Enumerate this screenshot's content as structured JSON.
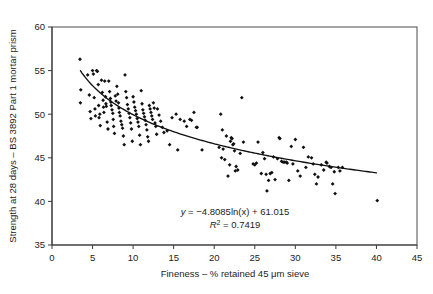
{
  "chart_data": {
    "type": "scatter",
    "title": "",
    "subtitle": "",
    "xlabel": "Fineness – % retained 45 μm sieve",
    "ylabel": "Strength at 28 days – BS 3892 Part 1 mortar prism",
    "xlim": [
      0,
      45
    ],
    "ylim": [
      35,
      60
    ],
    "xticks": [
      0,
      5,
      10,
      15,
      20,
      25,
      30,
      35,
      40,
      45
    ],
    "yticks": [
      35,
      40,
      45,
      50,
      55,
      60
    ],
    "xtick_labels": [
      "0",
      "5",
      "10",
      "15",
      "20",
      "25",
      "30",
      "35",
      "40",
      "45"
    ],
    "ytick_labels": [
      "35",
      "40",
      "45",
      "50",
      "55",
      "60"
    ],
    "grid": false,
    "legend": false,
    "legend_position": "none",
    "marker_color": "#111111",
    "curve_color": "#111111",
    "border_color": "#4a4a4a",
    "annotations": [
      {
        "name": "regression-equation",
        "text": "y = −4.8085ln(x) + 61.015",
        "x": 22.5,
        "y": 38.6
      },
      {
        "name": "r-squared",
        "text": "R² = 0.7419",
        "x": 22.5,
        "y": 37.5
      }
    ],
    "equation": {
      "variable_y": "y",
      "equals": "= −4.8085ln(x) + 61.015",
      "r_symbol": "R",
      "r_exponent": "2",
      "r_value": "= 0.7419",
      "slope_coefficient": -4.8085,
      "intercept": 61.015,
      "r_squared": 0.7419,
      "form": "logarithmic"
    },
    "fit_curve": {
      "type": "logarithmic",
      "expression": "y = -4.8085*ln(x) + 61.015",
      "x_start": 3.5,
      "x_end": 40.0
    },
    "series": [
      {
        "name": "Cement samples",
        "points": [
          [
            3.45,
            56.3
          ],
          [
            3.55,
            52.8
          ],
          [
            3.5,
            51.3
          ],
          [
            4.4,
            54.5
          ],
          [
            4.6,
            52.2
          ],
          [
            4.7,
            50.3
          ],
          [
            4.8,
            49.5
          ],
          [
            5.0,
            55.0
          ],
          [
            5.1,
            54.6
          ],
          [
            5.2,
            51.9
          ],
          [
            5.3,
            50.6
          ],
          [
            5.35,
            49.8
          ],
          [
            5.5,
            55.0
          ],
          [
            5.6,
            54.9
          ],
          [
            5.7,
            53.4
          ],
          [
            5.75,
            51.0
          ],
          [
            5.8,
            49.6
          ],
          [
            5.9,
            50.0
          ],
          [
            5.95,
            48.7
          ],
          [
            6.1,
            53.9
          ],
          [
            6.2,
            52.5
          ],
          [
            6.3,
            51.6
          ],
          [
            6.35,
            50.8
          ],
          [
            6.4,
            50.2
          ],
          [
            6.5,
            53.8
          ],
          [
            6.6,
            52.0
          ],
          [
            6.65,
            51.2
          ],
          [
            6.7,
            50.9
          ],
          [
            6.8,
            49.1
          ],
          [
            6.9,
            48.3
          ],
          [
            7.0,
            53.8
          ],
          [
            7.1,
            52.6
          ],
          [
            7.2,
            51.8
          ],
          [
            7.25,
            51.4
          ],
          [
            7.3,
            51.0
          ],
          [
            7.4,
            50.5
          ],
          [
            7.5,
            50.1
          ],
          [
            7.55,
            49.4
          ],
          [
            7.6,
            48.6
          ],
          [
            7.7,
            47.8
          ],
          [
            7.8,
            52.1
          ],
          [
            7.9,
            51.5
          ],
          [
            8.0,
            53.2
          ],
          [
            8.1,
            52.3
          ],
          [
            8.2,
            51.3
          ],
          [
            8.25,
            50.7
          ],
          [
            8.3,
            50.2
          ],
          [
            8.4,
            49.8
          ],
          [
            8.5,
            49.2
          ],
          [
            8.6,
            48.8
          ],
          [
            8.7,
            48.4
          ],
          [
            8.8,
            47.5
          ],
          [
            8.9,
            46.5
          ],
          [
            9.0,
            54.5
          ],
          [
            9.1,
            52.6
          ],
          [
            9.2,
            51.9
          ],
          [
            9.3,
            51.1
          ],
          [
            9.4,
            50.6
          ],
          [
            9.5,
            50.1
          ],
          [
            9.6,
            49.6
          ],
          [
            9.7,
            49.0
          ],
          [
            9.8,
            48.3
          ],
          [
            9.9,
            46.9
          ],
          [
            10.0,
            52.0
          ],
          [
            10.1,
            51.4
          ],
          [
            10.2,
            50.8
          ],
          [
            10.3,
            50.4
          ],
          [
            10.4,
            50.0
          ],
          [
            10.5,
            49.5
          ],
          [
            10.6,
            49.1
          ],
          [
            10.7,
            48.6
          ],
          [
            10.8,
            47.6
          ],
          [
            10.9,
            46.5
          ],
          [
            11.0,
            52.7
          ],
          [
            11.1,
            51.2
          ],
          [
            11.2,
            50.5
          ],
          [
            11.3,
            50.1
          ],
          [
            11.4,
            49.7
          ],
          [
            11.5,
            49.3
          ],
          [
            11.6,
            48.8
          ],
          [
            11.7,
            48.2
          ],
          [
            11.8,
            47.4
          ],
          [
            11.9,
            46.9
          ],
          [
            12.0,
            51.0
          ],
          [
            12.1,
            50.6
          ],
          [
            12.2,
            50.2
          ],
          [
            12.3,
            49.8
          ],
          [
            12.4,
            49.4
          ],
          [
            12.5,
            51.3
          ],
          [
            12.6,
            50.7
          ],
          [
            12.7,
            49.0
          ],
          [
            12.8,
            48.6
          ],
          [
            12.9,
            47.7
          ],
          [
            13.0,
            50.6
          ],
          [
            13.2,
            49.9
          ],
          [
            13.4,
            49.2
          ],
          [
            13.6,
            48.5
          ],
          [
            13.8,
            47.9
          ],
          [
            14.2,
            48.1
          ],
          [
            14.5,
            46.5
          ],
          [
            14.8,
            49.6
          ],
          [
            15.3,
            50.0
          ],
          [
            15.5,
            45.9
          ],
          [
            15.8,
            49.4
          ],
          [
            16.3,
            49.2
          ],
          [
            16.6,
            48.6
          ],
          [
            17.0,
            49.4
          ],
          [
            17.2,
            49.3
          ],
          [
            17.5,
            50.2
          ],
          [
            17.8,
            48.5
          ],
          [
            17.9,
            48.5
          ],
          [
            18.5,
            45.9
          ],
          [
            20.6,
            46.2
          ],
          [
            20.8,
            50.0
          ],
          [
            20.9,
            45.0
          ],
          [
            21.0,
            48.2
          ],
          [
            21.1,
            46.0
          ],
          [
            21.3,
            44.8
          ],
          [
            21.5,
            47.5
          ],
          [
            21.7,
            42.9
          ],
          [
            21.9,
            44.2
          ],
          [
            22.0,
            46.9
          ],
          [
            22.1,
            47.3
          ],
          [
            22.2,
            47.2
          ],
          [
            22.3,
            46.5
          ],
          [
            22.4,
            46.6
          ],
          [
            22.5,
            45.8
          ],
          [
            22.6,
            43.5
          ],
          [
            22.7,
            44.0
          ],
          [
            22.9,
            43.6
          ],
          [
            23.2,
            45.5
          ],
          [
            23.4,
            51.9
          ],
          [
            23.6,
            46.8
          ],
          [
            24.8,
            44.3
          ],
          [
            25.0,
            44.2
          ],
          [
            25.2,
            44.4
          ],
          [
            25.4,
            46.8
          ],
          [
            25.8,
            43.2
          ],
          [
            26.0,
            45.6
          ],
          [
            26.2,
            44.9
          ],
          [
            26.4,
            43.1
          ],
          [
            26.5,
            41.2
          ],
          [
            26.7,
            42.4
          ],
          [
            26.9,
            43.2
          ],
          [
            27.1,
            43.3
          ],
          [
            27.3,
            45.1
          ],
          [
            27.5,
            42.5
          ],
          [
            27.8,
            44.9
          ],
          [
            28.0,
            47.3
          ],
          [
            28.1,
            47.2
          ],
          [
            28.3,
            44.6
          ],
          [
            28.5,
            44.5
          ],
          [
            28.7,
            44.5
          ],
          [
            28.9,
            44.5
          ],
          [
            29.0,
            44.4
          ],
          [
            29.2,
            42.4
          ],
          [
            29.5,
            46.3
          ],
          [
            29.7,
            44.3
          ],
          [
            30.0,
            47.1
          ],
          [
            30.3,
            43.5
          ],
          [
            30.6,
            42.9
          ],
          [
            31.0,
            46.2
          ],
          [
            31.3,
            43.9
          ],
          [
            31.6,
            45.1
          ],
          [
            32.0,
            45.0
          ],
          [
            32.2,
            44.3
          ],
          [
            32.4,
            43.1
          ],
          [
            32.6,
            42.0
          ],
          [
            32.8,
            42.8
          ],
          [
            33.2,
            44.2
          ],
          [
            33.5,
            43.6
          ],
          [
            33.8,
            44.5
          ],
          [
            33.9,
            44.4
          ],
          [
            34.2,
            44.0
          ],
          [
            34.4,
            43.9
          ],
          [
            34.6,
            42.0
          ],
          [
            34.8,
            43.4
          ],
          [
            34.9,
            40.9
          ],
          [
            35.3,
            43.9
          ],
          [
            35.5,
            43.5
          ],
          [
            35.8,
            43.9
          ],
          [
            40.1,
            40.1
          ]
        ]
      }
    ]
  },
  "figure": {
    "background": "#ffffff",
    "axis_color": "#3a3a3a"
  }
}
